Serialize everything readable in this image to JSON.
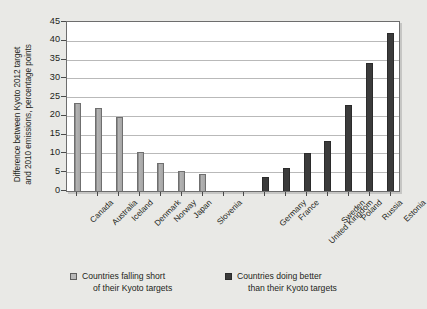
{
  "chart_data": {
    "type": "bar",
    "title": "",
    "xlabel": "",
    "ylabel": "Difference between Kyoto 2012 target and 2010 emissions, percentage points",
    "ylim": [
      0,
      45
    ],
    "yticks": [
      0,
      5,
      10,
      15,
      20,
      25,
      30,
      35,
      40,
      45
    ],
    "grid": true,
    "legend_position": "bottom",
    "categories": [
      "Canada",
      "Australia",
      "Iceland",
      "Denmark",
      "Norway",
      "Japan",
      "Slovenia",
      "",
      "Germany",
      "France",
      "United Kingdom",
      "Sweden",
      "Poland",
      "Russia",
      "Estonia"
    ],
    "series": [
      {
        "name": "Countries falling short of their Kyoto targets",
        "color": "#a6a6a6",
        "values": [
          23.4,
          22.0,
          19.7,
          10.5,
          7.4,
          5.4,
          4.6,
          null,
          null,
          null,
          null,
          null,
          null,
          null,
          null
        ]
      },
      {
        "name": "Countries doing better than their Kyoto targets",
        "color": "#3b3b3b",
        "values": [
          null,
          null,
          null,
          null,
          null,
          null,
          null,
          null,
          3.8,
          6.1,
          10.2,
          13.2,
          23.0,
          34.2,
          42.0
        ]
      }
    ],
    "bars": [
      {
        "label": "Canada",
        "value": 23.4,
        "group": "short"
      },
      {
        "label": "Australia",
        "value": 22.0,
        "group": "short"
      },
      {
        "label": "Iceland",
        "value": 19.7,
        "group": "short"
      },
      {
        "label": "Denmark",
        "value": 10.5,
        "group": "short"
      },
      {
        "label": "Norway",
        "value": 7.4,
        "group": "short"
      },
      {
        "label": "Japan",
        "value": 5.4,
        "group": "short"
      },
      {
        "label": "Slovenia",
        "value": 4.6,
        "group": "short"
      },
      {
        "label": "Germany",
        "value": 3.8,
        "group": "better"
      },
      {
        "label": "France",
        "value": 6.1,
        "group": "better"
      },
      {
        "label": "United Kingdom",
        "value": 10.2,
        "group": "better"
      },
      {
        "label": "Sweden",
        "value": 13.2,
        "group": "better"
      },
      {
        "label": "Poland",
        "value": 23.0,
        "group": "better"
      },
      {
        "label": "Russia",
        "value": 34.2,
        "group": "better"
      },
      {
        "label": "Estonia",
        "value": 42.0,
        "group": "better"
      }
    ]
  },
  "axis": {
    "y_title_line1": "Difference between Kyoto 2012 target",
    "y_title_line2": "and 2010 emissions, percentage points"
  },
  "legend": {
    "short": {
      "line1": "Countries falling short",
      "line2": "of their Kyoto targets"
    },
    "better": {
      "line1": "Countries doing better",
      "line2": "than their Kyoto targets"
    }
  },
  "colors": {
    "bar_light": "#a6a6a6",
    "bar_dark": "#3b3b3b",
    "plot_background": "#ffffff",
    "page_background": "#e9e9e6",
    "gridline": "#b9b9b9",
    "text": "#231f20"
  }
}
